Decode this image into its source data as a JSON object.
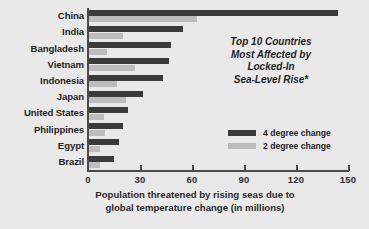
{
  "chart_data": {
    "type": "bar",
    "orientation": "horizontal",
    "title": "",
    "annotation": [
      "Top 10 Countries",
      "Most Affected by",
      "Locked-In",
      "Sea-Level Rise*"
    ],
    "categories": [
      "China",
      "India",
      "Bangladesh",
      "Vietnam",
      "Indonesia",
      "Japan",
      "United States",
      "Philippines",
      "Egypt",
      "Brazil"
    ],
    "series": [
      {
        "name": "4 degree change",
        "color": "#3b3b3b",
        "values": [
          144,
          55,
          48,
          47,
          43,
          32,
          23,
          20,
          18,
          15
        ]
      },
      {
        "name": "2 degree change",
        "color": "#bcbcbc",
        "values": [
          63,
          20,
          11,
          27,
          17,
          22,
          9,
          10,
          7,
          7
        ]
      }
    ],
    "xlabel": [
      "Population threatened by rising seas due to",
      "global temperature change (in millions)"
    ],
    "ylabel": "",
    "xlim": [
      0,
      150
    ],
    "xticks": [
      "0",
      "30",
      "60",
      "90",
      "120",
      "150"
    ],
    "grid": false,
    "legend_position": "inside-right"
  },
  "legend": {
    "items": [
      {
        "label": "4 degree change",
        "color": "#3b3b3b"
      },
      {
        "label": "2 degree change",
        "color": "#bcbcbc"
      }
    ]
  },
  "colors": {
    "background": "#e9e9e9",
    "axis": "#4a4a4a",
    "text": "#242424",
    "series_4deg": "#3b3b3b",
    "series_2deg": "#bcbcbc"
  }
}
